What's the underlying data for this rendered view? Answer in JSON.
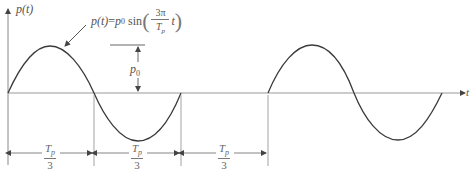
{
  "diagram": {
    "y_axis_label": "p(t)",
    "x_axis_label": "t",
    "formula": {
      "lhs": "p(t)",
      "equals": "=",
      "amplitude": "p",
      "amplitude_sub": "0",
      "func": "sin",
      "numerator": "3π",
      "denominator": "T",
      "denominator_sub": "p",
      "variable": "t"
    },
    "amplitude_marker": {
      "label": "p",
      "sub": "0"
    },
    "intervals": [
      {
        "numerator": "T",
        "numerator_sub": "p",
        "denominator": "3"
      },
      {
        "numerator": "T",
        "numerator_sub": "p",
        "denominator": "3"
      },
      {
        "numerator": "T",
        "numerator_sub": "p",
        "denominator": "3"
      }
    ],
    "colors": {
      "curve": "#3a3a3a",
      "axis": "#777777",
      "text": "#555555"
    }
  }
}
